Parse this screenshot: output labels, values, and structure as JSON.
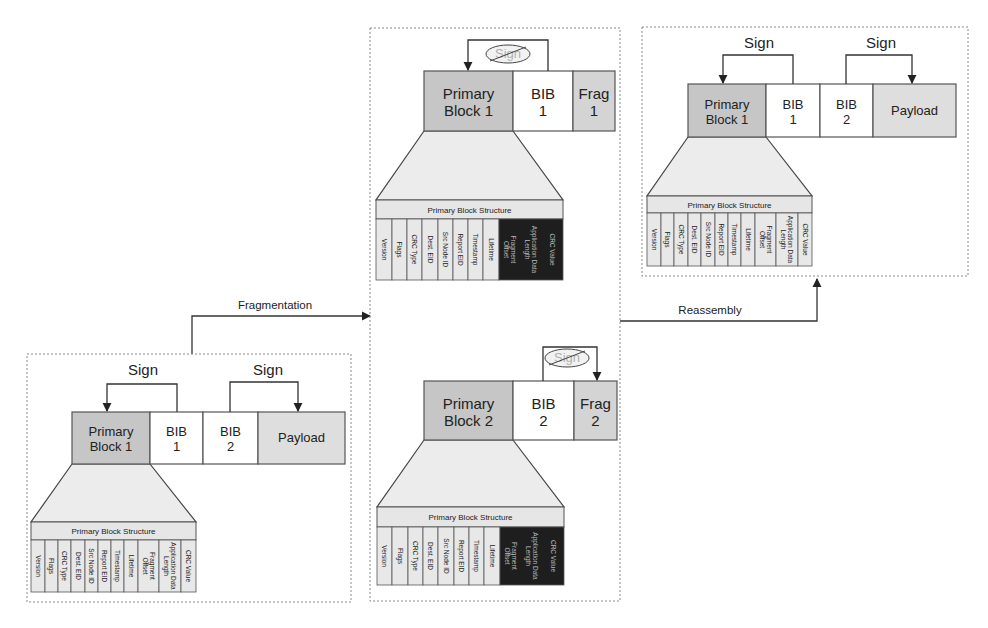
{
  "colors": {
    "primary_block": "#c6c6c6",
    "bib_block": "#ffffff",
    "payload_block": "#dedede",
    "frag_block": "#d4d4d4",
    "table_cell": "#e8e8e8",
    "table_cell_dark": "#1e1e1e",
    "text_dark": "#222222",
    "text_light": "#bbbbbb",
    "sign_cancel_fill": "#f2f2f2",
    "sign_cancel_text": "#b0b0b0"
  },
  "flows": {
    "fragmentation_label": "Fragmentation",
    "reassembly_label": "Reassembly"
  },
  "sign_label": "Sign",
  "table": {
    "title": "Primary Block Structure",
    "columns": [
      "Version",
      "Flags",
      "CRC Type",
      "Dest. EID",
      "Src Node ID",
      "Report EID",
      "Timestamp",
      "Lifetime",
      "Fragment Offset",
      "Application Data Length",
      "CRC Value"
    ]
  },
  "panels": [
    {
      "id": "original-bundle",
      "name": "original-bundle-panel",
      "border": {
        "x": 27,
        "y": 354,
        "w": 324,
        "h": 248
      },
      "blocks": [
        {
          "line1": "Primary",
          "line2": "Block 1",
          "kind": "primary",
          "x": 72,
          "y": 412,
          "w": 78,
          "h": 52
        },
        {
          "line1": "BIB",
          "line2": "1",
          "kind": "bib",
          "x": 150,
          "y": 412,
          "w": 53,
          "h": 52
        },
        {
          "line1": "BIB",
          "line2": "2",
          "kind": "bib",
          "x": 203,
          "y": 412,
          "w": 55,
          "h": 52
        },
        {
          "line1": "Payload",
          "line2": "",
          "kind": "payload",
          "x": 258,
          "y": 412,
          "w": 87,
          "h": 52
        }
      ],
      "signs": [
        {
          "label": "Sign",
          "from_x": 177,
          "to_x": 107,
          "top_y": 384,
          "bottom_y": 412,
          "label_x": 143,
          "label_y": 375,
          "cancelled": false
        },
        {
          "label": "Sign",
          "from_x": 230,
          "to_x": 298,
          "top_y": 382,
          "bottom_y": 412,
          "label_x": 268,
          "label_y": 375,
          "cancelled": false
        }
      ],
      "table": {
        "x": 31,
        "y": 522,
        "w": 165,
        "head_h": 18,
        "body_h": 52,
        "trap_top_y": 464,
        "trap_top_x1": 72,
        "trap_top_x2": 150,
        "dark_from": -1,
        "col_edges": [
          31,
          45,
          58,
          71,
          85,
          98,
          111,
          124,
          138,
          159,
          181,
          196
        ]
      }
    },
    {
      "id": "fragment-1",
      "name": "fragment-1-panel",
      "border": {
        "x": 370,
        "y": 28,
        "w": 250,
        "h": 573
      },
      "blocks": [
        {
          "line1": "Primary",
          "line2": "Block 1",
          "kind": "primary",
          "x": 424,
          "y": 71,
          "w": 89,
          "h": 60
        },
        {
          "line1": "BIB",
          "line2": "1",
          "kind": "bib",
          "x": 513,
          "y": 71,
          "w": 60,
          "h": 60
        },
        {
          "line1": "Frag",
          "line2": "1",
          "kind": "frag",
          "x": 573,
          "y": 71,
          "w": 42,
          "h": 60
        }
      ],
      "signs": [
        {
          "label": "Sign",
          "from_x": 548,
          "to_x": 468,
          "top_y": 40,
          "bottom_y": 71,
          "label_x": 508,
          "label_y": 58,
          "cancelled": true
        }
      ],
      "table": {
        "x": 376,
        "y": 200,
        "w": 187,
        "head_h": 19,
        "body_h": 61,
        "trap_top_y": 131,
        "trap_top_x1": 424,
        "trap_top_x2": 513,
        "dark_from": 8,
        "col_edges": [
          376,
          392,
          407,
          422,
          438,
          453,
          468,
          483,
          499,
          563
        ]
      }
    },
    {
      "id": "fragment-2",
      "name": "fragment-2-panel",
      "border": null,
      "blocks": [
        {
          "line1": "Primary",
          "line2": "Block 2",
          "kind": "primary",
          "x": 424,
          "y": 381,
          "w": 89,
          "h": 59
        },
        {
          "line1": "BIB",
          "line2": "2",
          "kind": "bib",
          "x": 513,
          "y": 381,
          "w": 61,
          "h": 59
        },
        {
          "line1": "Frag",
          "line2": "2",
          "kind": "frag",
          "x": 574,
          "y": 381,
          "w": 43,
          "h": 59
        }
      ],
      "signs": [
        {
          "label": "Sign",
          "from_x": 543,
          "to_x": 597,
          "top_y": 347,
          "bottom_y": 381,
          "label_x": 567,
          "label_y": 362,
          "cancelled": true
        }
      ],
      "table": {
        "x": 377,
        "y": 507,
        "w": 187,
        "head_h": 20,
        "body_h": 58,
        "trap_top_y": 440,
        "trap_top_x1": 424,
        "trap_top_x2": 513,
        "dark_from": 8,
        "col_edges": [
          377,
          392,
          408,
          423,
          438,
          454,
          469,
          484,
          500,
          564
        ]
      }
    },
    {
      "id": "reassembled-bundle",
      "name": "reassembled-bundle-panel",
      "border": {
        "x": 642,
        "y": 27,
        "w": 326,
        "h": 249
      },
      "blocks": [
        {
          "line1": "Primary",
          "line2": "Block 1",
          "kind": "primary",
          "x": 688,
          "y": 84,
          "w": 78,
          "h": 53
        },
        {
          "line1": "BIB",
          "line2": "1",
          "kind": "bib",
          "x": 766,
          "y": 84,
          "w": 54,
          "h": 53
        },
        {
          "line1": "BIB",
          "line2": "2",
          "kind": "bib",
          "x": 820,
          "y": 84,
          "w": 53,
          "h": 53
        },
        {
          "line1": "Payload",
          "line2": "",
          "kind": "payload",
          "x": 873,
          "y": 84,
          "w": 83,
          "h": 53
        }
      ],
      "signs": [
        {
          "label": "Sign",
          "from_x": 793,
          "to_x": 723,
          "top_y": 55,
          "bottom_y": 84,
          "label_x": 759,
          "label_y": 48,
          "cancelled": false
        },
        {
          "label": "Sign",
          "from_x": 846,
          "to_x": 912,
          "top_y": 55,
          "bottom_y": 84,
          "label_x": 881,
          "label_y": 48,
          "cancelled": false
        }
      ],
      "table": {
        "x": 647,
        "y": 196,
        "w": 165,
        "head_h": 17,
        "body_h": 53,
        "trap_top_y": 137,
        "trap_top_x1": 688,
        "trap_top_x2": 766,
        "dark_from": -1,
        "col_edges": [
          647,
          661,
          674,
          688,
          701,
          715,
          728,
          741,
          755,
          776,
          798,
          812
        ]
      }
    }
  ],
  "arrows": {
    "fragmentation": {
      "points": [
        [
          192,
          354
        ],
        [
          192,
          316
        ],
        [
          370,
          316
        ]
      ],
      "label_x": 275,
      "label_y": 309
    },
    "reassembly": {
      "points": [
        [
          620,
          321
        ],
        [
          817,
          321
        ],
        [
          817,
          279
        ]
      ],
      "label_x": 710,
      "label_y": 314
    }
  }
}
